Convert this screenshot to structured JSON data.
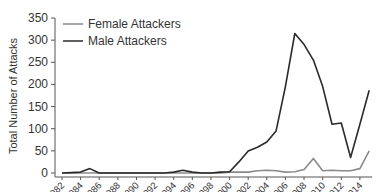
{
  "chart_data": {
    "type": "line",
    "title": "",
    "xlabel": "",
    "ylabel": "Total Number of Attacks",
    "ylim": [
      0,
      350
    ],
    "yticks": [
      0,
      50,
      100,
      150,
      200,
      250,
      300,
      350
    ],
    "xticks": [
      "1982",
      "1984",
      "1986",
      "1988",
      "1990",
      "1992",
      "1994",
      "1996",
      "1998",
      "2000",
      "2002",
      "2004",
      "2006",
      "2008",
      "2010",
      "2012",
      "2014"
    ],
    "grid": false,
    "legend_position": "upper-left-inside",
    "x": [
      1982,
      1983,
      1984,
      1985,
      1986,
      1987,
      1988,
      1989,
      1990,
      1991,
      1992,
      1993,
      1994,
      1995,
      1996,
      1997,
      1998,
      1999,
      2000,
      2001,
      2002,
      2003,
      2004,
      2005,
      2006,
      2007,
      2008,
      2009,
      2010,
      2011,
      2012,
      2013,
      2014,
      2015
    ],
    "series": [
      {
        "name": "Female Attackers",
        "color": "#8a8a8a",
        "values": [
          0,
          0,
          0,
          0,
          0,
          0,
          0,
          0,
          0,
          0,
          0,
          0,
          0,
          0,
          0,
          0,
          0,
          0,
          2,
          2,
          2,
          5,
          6,
          5,
          2,
          3,
          8,
          33,
          5,
          6,
          5,
          5,
          10,
          50
        ]
      },
      {
        "name": "Male Attackers",
        "color": "#2a2a2a",
        "values": [
          0,
          1,
          2,
          10,
          0,
          0,
          0,
          0,
          0,
          0,
          0,
          0,
          2,
          6,
          2,
          0,
          0,
          2,
          3,
          25,
          50,
          58,
          70,
          95,
          195,
          315,
          290,
          255,
          195,
          110,
          113,
          35,
          110,
          187
        ]
      }
    ]
  },
  "legend": {
    "items": [
      {
        "label": "Female Attackers"
      },
      {
        "label": "Male Attackers"
      }
    ]
  },
  "axis": {
    "ylabel": "Total Number of Attacks"
  }
}
